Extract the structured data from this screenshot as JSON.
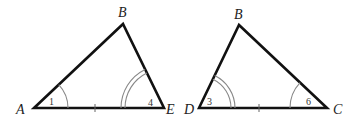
{
  "figure": {
    "triangles": [
      {
        "name": "ABE",
        "vertices": {
          "A": {
            "label": "A"
          },
          "B": {
            "label": "B"
          },
          "E": {
            "label": "E"
          }
        },
        "angles": [
          {
            "vertex": "A",
            "label": "1",
            "arc_count": 1
          },
          {
            "vertex": "E",
            "label": "4",
            "arc_count": 2
          }
        ],
        "tick_marks": [
          {
            "side": "AE",
            "count": 1
          }
        ]
      },
      {
        "name": "DBC",
        "vertices": {
          "D": {
            "label": "D"
          },
          "B": {
            "label": "B"
          },
          "C": {
            "label": "C"
          }
        },
        "angles": [
          {
            "vertex": "D",
            "label": "3",
            "arc_count": 2
          },
          {
            "vertex": "C",
            "label": "6",
            "arc_count": 1
          }
        ],
        "tick_marks": [
          {
            "side": "DC",
            "count": 1
          }
        ]
      }
    ],
    "colors": {
      "edge": "#111111",
      "arc": "#888888",
      "text": "#222222"
    }
  }
}
